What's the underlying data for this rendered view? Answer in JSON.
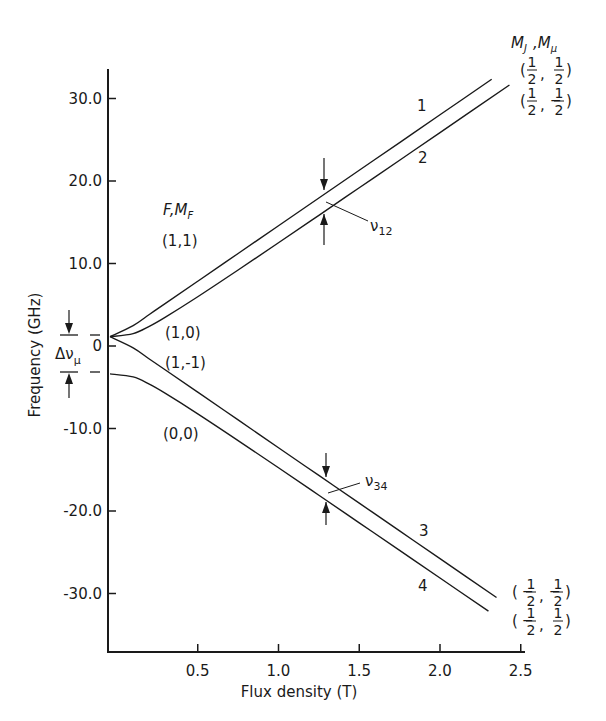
{
  "chart_data": {
    "type": "line",
    "title": "",
    "xlabel": "Flux density (T)",
    "ylabel": "Frequency (GHz)",
    "xlim": [
      0,
      2.5
    ],
    "ylim": [
      -36,
      34
    ],
    "x_ticks": [
      0.5,
      1.0,
      1.5,
      2.0,
      2.5
    ],
    "x_tick_labels": [
      "0.5",
      "1.0",
      "1.5",
      "2.0",
      "2.5"
    ],
    "y_ticks": [
      30,
      20,
      10,
      0,
      -10,
      -20,
      -30
    ],
    "y_tick_labels": [
      "30.0",
      "20.0",
      "10.0",
      "0",
      "-10.0",
      "-20.0",
      "-30.0"
    ],
    "grid": false,
    "series": [
      {
        "name": "1",
        "quantum_F_MF": "(1,1)",
        "high_field": "(1/2, 1/2)",
        "x": [
          0,
          0.1,
          0.2,
          0.3,
          0.5,
          0.75,
          1.0,
          1.25,
          1.5,
          1.75,
          2.0,
          2.32
        ],
        "y": [
          1.13,
          2.47,
          3.82,
          5.16,
          7.85,
          11.21,
          14.58,
          17.94,
          21.3,
          24.66,
          28.03,
          32.33
        ]
      },
      {
        "name": "2",
        "quantum_F_MF": "(1,0)",
        "high_field": "(1/2, -1/2)",
        "x": [
          0,
          0.1,
          0.2,
          0.3,
          0.5,
          0.75,
          1.0,
          1.25,
          1.5,
          1.75,
          2.0,
          2.43
        ],
        "y": [
          1.13,
          1.5,
          2.38,
          3.5,
          5.97,
          9.21,
          12.51,
          15.84,
          19.18,
          22.52,
          25.87,
          31.64
        ]
      },
      {
        "name": "3",
        "quantum_F_MF": "(1,-1)",
        "high_field": "(-1/2, -1/2)",
        "x": [
          0,
          0.1,
          0.2,
          0.3,
          0.5,
          0.75,
          1.0,
          1.25,
          1.5,
          1.75,
          2.0,
          2.35
        ],
        "y": [
          1.13,
          -0.22,
          -1.57,
          -2.91,
          -5.6,
          -8.96,
          -12.33,
          -15.69,
          -19.05,
          -22.41,
          -25.78,
          -30.48
        ]
      },
      {
        "name": "4",
        "quantum_F_MF": "(0,0)",
        "high_field": "(-1/2, 1/2)",
        "x": [
          0,
          0.1,
          0.2,
          0.3,
          0.5,
          0.75,
          1.0,
          1.25,
          1.5,
          1.75,
          2.0,
          2.3
        ],
        "y": [
          -3.38,
          -3.75,
          -4.63,
          -5.75,
          -8.22,
          -11.46,
          -14.76,
          -18.09,
          -21.43,
          -24.77,
          -28.12,
          -32.14
        ]
      }
    ],
    "annotations": {
      "left_header": "F, M_F",
      "right_header": "M_J , M_μ",
      "zero_field_labels": [
        "(1,1)",
        "(1,0)",
        "(1,-1)",
        "(0,0)"
      ],
      "line_numbers": [
        "1",
        "2",
        "3",
        "4"
      ],
      "transition_12": "ν12",
      "transition_34": "ν34",
      "hyperfine_splitting": "Δν_μ",
      "transition_B": 1.3
    }
  },
  "labels": {
    "xlabel": "Flux density (T)",
    "ylabel": "Frequency (GHz)",
    "F": "F",
    "comma": ",",
    "M": "M",
    "sub_F": "F",
    "sub_J": "J",
    "sub_mu": "μ",
    "fmf_11": "(1,1)",
    "fmf_10": "(1,0)",
    "fmf_1m1": "(1,-1)",
    "fmf_00": "(0,0)",
    "n1": "1",
    "n2": "2",
    "n3": "3",
    "n4": "4",
    "nu": "ν",
    "sub12": "12",
    "sub34": "34",
    "delta_nu": "Δν",
    "one": "1",
    "two": "2",
    "open": "(",
    "close": ")",
    "sep": ",",
    "neg_open": "(−",
    "neg_sep": ", −",
    "pos_sep": " , ",
    "neg": "−"
  }
}
